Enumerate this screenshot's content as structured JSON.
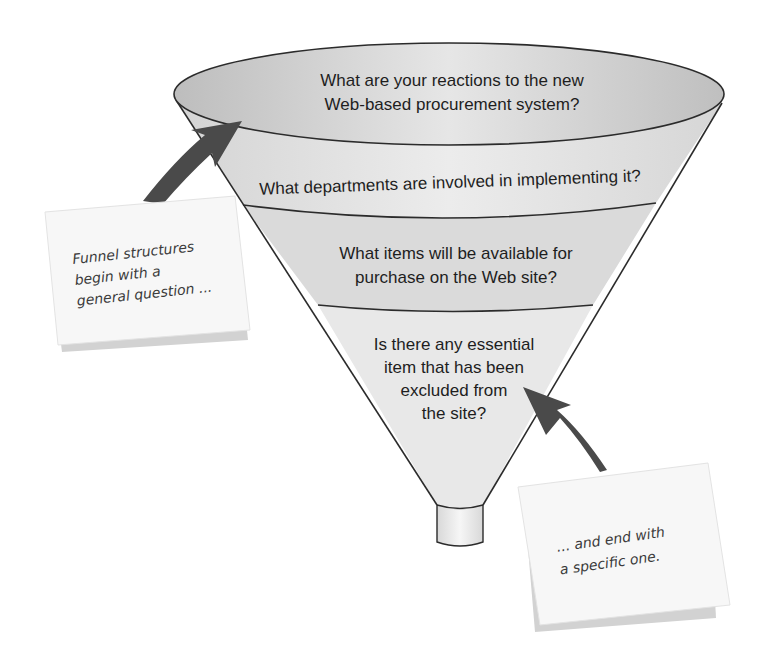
{
  "diagram": {
    "type": "funnel",
    "colors": {
      "rim_fill": "#d9d9d9",
      "band_fill": "#e4e4e4",
      "band_fill_alt": "#dcdcdc",
      "outline": "#2b2b2b",
      "arrow": "#4a4a4a",
      "note_fill": "#f7f7f7",
      "note_shadow": "#d0d0d0"
    },
    "levels": [
      {
        "lines": [
          "What are your reactions to the new",
          "Web-based procurement system?"
        ]
      },
      {
        "lines": [
          "What departments are involved in implementing it?"
        ]
      },
      {
        "lines": [
          "What items will be available for",
          "purchase on the Web site?"
        ]
      },
      {
        "lines": [
          "Is there any essential",
          "item that has been",
          "excluded from",
          "the site?"
        ]
      }
    ],
    "notes": [
      {
        "position": "left",
        "lines": [
          "Funnel structures",
          "begin with a",
          "general question ..."
        ]
      },
      {
        "position": "right",
        "lines": [
          "... and end with",
          "a specific one."
        ]
      }
    ]
  }
}
